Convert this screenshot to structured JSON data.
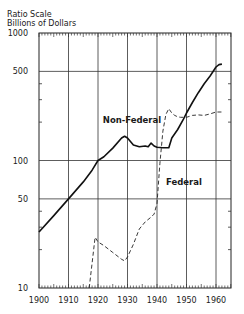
{
  "chart_data": {
    "type": "line",
    "title": "",
    "ylabel_lines": [
      "Ratio Scale",
      "Billions of Dollars"
    ],
    "xlabel": "",
    "yscale": "log",
    "ylim": [
      10,
      1000
    ],
    "xlim": [
      1900,
      1965
    ],
    "grid": true,
    "x_ticks": [
      1900,
      1910,
      1920,
      1930,
      1940,
      1950,
      1960
    ],
    "x_tick_labels": [
      "1900",
      "1910",
      "1920",
      "1930",
      "1940",
      "1950",
      "1960"
    ],
    "y_ticks": [
      10,
      50,
      100,
      500,
      1000
    ],
    "y_tick_labels": [
      "10",
      "50",
      "100",
      "500",
      "1000"
    ],
    "y_minor_ticks": [
      20,
      30,
      40,
      200,
      300,
      400
    ],
    "series": [
      {
        "name": "Non-Federal",
        "style": "solid-thick",
        "label_position": "above-left of 1930 peak",
        "points": [
          [
            1900,
            27.5
          ],
          [
            1905,
            37
          ],
          [
            1910,
            50
          ],
          [
            1915,
            68
          ],
          [
            1918,
            84
          ],
          [
            1920,
            100
          ],
          [
            1922,
            107
          ],
          [
            1925,
            125
          ],
          [
            1928,
            150
          ],
          [
            1929,
            155
          ],
          [
            1930,
            150
          ],
          [
            1932,
            132
          ],
          [
            1934,
            128
          ],
          [
            1936,
            130
          ],
          [
            1937,
            128
          ],
          [
            1938,
            137
          ],
          [
            1939,
            130
          ],
          [
            1940,
            127
          ],
          [
            1942,
            126
          ],
          [
            1944,
            126
          ],
          [
            1945,
            150
          ],
          [
            1947,
            175
          ],
          [
            1949,
            212
          ],
          [
            1950,
            236
          ],
          [
            1952,
            285
          ],
          [
            1954,
            340
          ],
          [
            1956,
            400
          ],
          [
            1958,
            460
          ],
          [
            1960,
            541
          ],
          [
            1961,
            565
          ],
          [
            1962,
            570
          ]
        ]
      },
      {
        "name": "Federal",
        "style": "dashed-thin",
        "label_position": "right of 1940 rise",
        "points": [
          [
            1917,
            9.5
          ],
          [
            1919,
            25
          ],
          [
            1920,
            23
          ],
          [
            1922,
            21.5
          ],
          [
            1925,
            19
          ],
          [
            1928,
            16.8
          ],
          [
            1929,
            16.3
          ],
          [
            1930,
            17.5
          ],
          [
            1932,
            22
          ],
          [
            1934,
            29
          ],
          [
            1936,
            33
          ],
          [
            1938,
            36
          ],
          [
            1939,
            38
          ],
          [
            1940,
            46
          ],
          [
            1941,
            95
          ],
          [
            1942,
            170
          ],
          [
            1943,
            230
          ],
          [
            1944,
            255
          ],
          [
            1945,
            236
          ],
          [
            1946,
            226
          ],
          [
            1947,
            220
          ],
          [
            1948,
            218
          ],
          [
            1950,
            218
          ],
          [
            1952,
            226
          ],
          [
            1954,
            228
          ],
          [
            1956,
            226
          ],
          [
            1958,
            232
          ],
          [
            1960,
            240
          ],
          [
            1962,
            240
          ]
        ]
      }
    ]
  }
}
